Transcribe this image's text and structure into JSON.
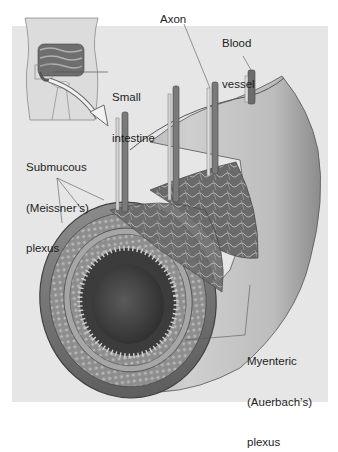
{
  "figure": {
    "colors": {
      "panel_background": "#e6e6e6",
      "label_text": "#1e1e1e",
      "leader_line": "#555555"
    }
  },
  "labels": {
    "small_intestine": [
      "Small",
      "intestine"
    ],
    "axon": "Axon",
    "blood_vessel": [
      "Blood",
      "vessel"
    ],
    "submucous_plexus": [
      "Submucous",
      "(Meissner’s)",
      "plexus"
    ],
    "myenteric_plexus": [
      "Myenteric",
      "(Auerbach’s)",
      "plexus"
    ]
  }
}
